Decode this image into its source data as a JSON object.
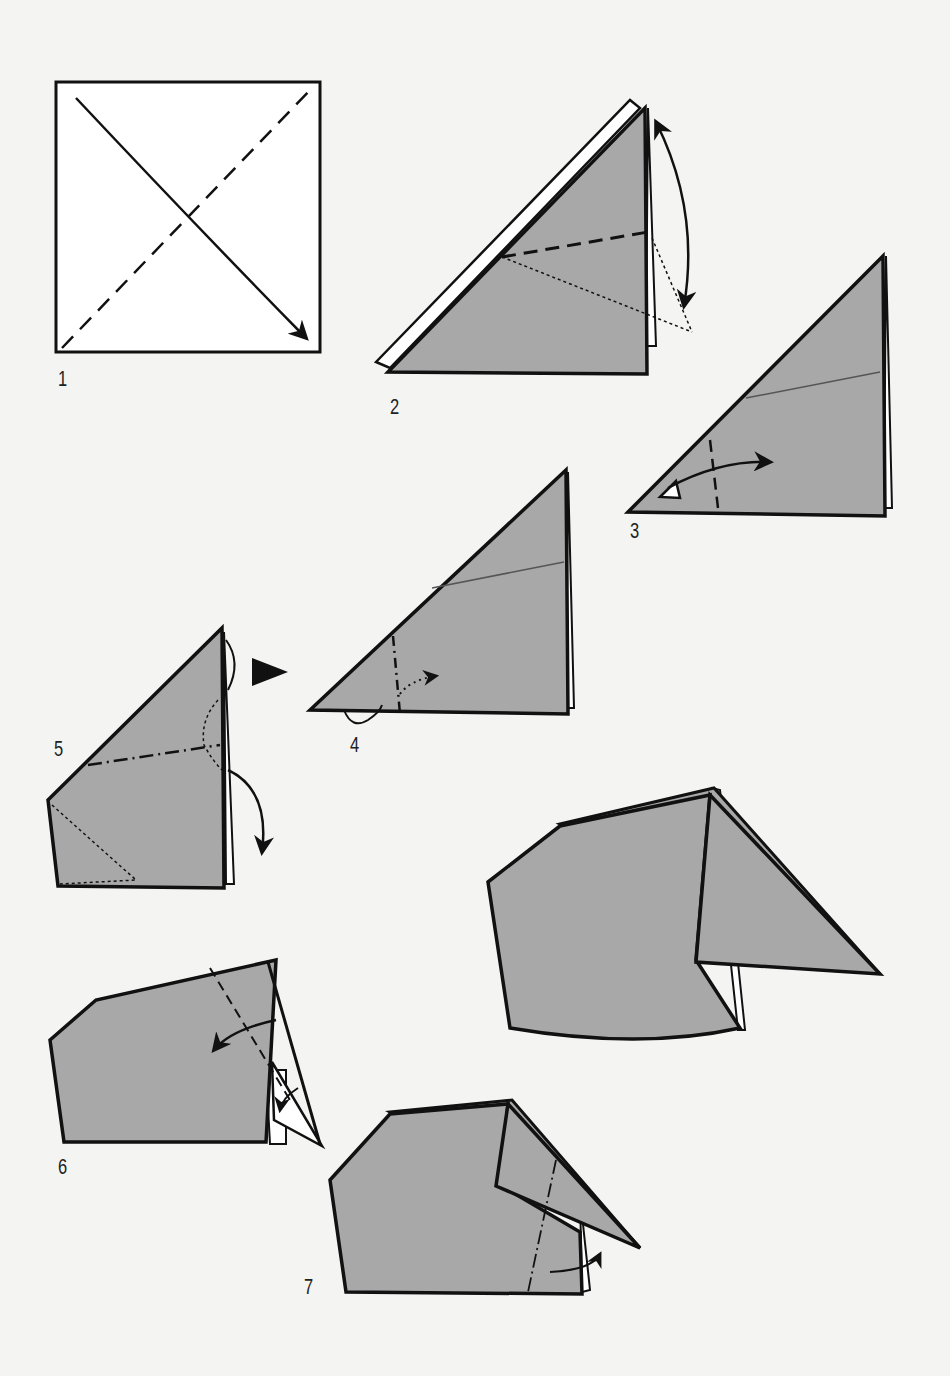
{
  "diagram": {
    "type": "origami-instructions",
    "paper_color": "#a8a8a8",
    "line_color": "#111111",
    "background": "#f4f4f3"
  },
  "steps": [
    {
      "number": "1",
      "description": "Square with a valley-fold diagonal (dashed) and arrow folding corner to corner"
    },
    {
      "number": "2",
      "description": "Triangle with hypotenuse divided into quarters; valley fold and hidden dotted line, two-way arrow"
    },
    {
      "number": "3",
      "description": "Triangle with crease line; small valley fold at bottom-left corner with fold-and-unfold arrow"
    },
    {
      "number": "4",
      "description": "Triangle with mountain fold line at lower left and inside-reverse arrow"
    },
    {
      "number": "5",
      "description": "Shape with mountain fold across, hidden dotted lines, push-in triangle arrow and fold-down arrow"
    },
    {
      "number": "6",
      "description": "Elephant head shape with ear; valley fold and arrows folding ear flap"
    },
    {
      "number": "7",
      "description": "Elephant head with folded ear; mountain fold line and tuck arrow"
    }
  ],
  "result": {
    "description": "Finished elephant head with ear/trunk point"
  }
}
